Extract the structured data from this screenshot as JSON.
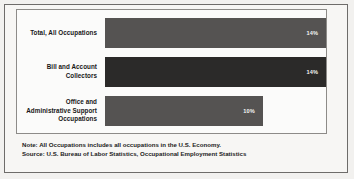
{
  "chart_data": {
    "type": "bar",
    "orientation": "horizontal",
    "title": "",
    "xlabel": "",
    "ylabel": "",
    "categories": [
      "Total, All Occupations",
      "Bill and Account Collectors",
      "Office and Administrative Support Occupations"
    ],
    "values": [
      14,
      14,
      10
    ],
    "value_labels": [
      "14%",
      "14%",
      "10%"
    ],
    "value_unit": "%",
    "xlim": [
      0,
      14
    ],
    "grid": false,
    "legend": false,
    "bar_colors": [
      "#555352",
      "#2b2a29",
      "#555352"
    ],
    "value_label_color": "#f3f3f3",
    "bars": [
      {
        "label_lines": [
          "Total, All Occupations"
        ],
        "value": 14,
        "value_label": "14%",
        "color": "#555352",
        "width_pct": 100
      },
      {
        "label_lines": [
          "Bill and Account",
          "Collectors"
        ],
        "value": 14,
        "value_label": "14%",
        "color": "#2b2a29",
        "width_pct": 100
      },
      {
        "label_lines": [
          "Office and",
          "Administrative Support",
          "Occupations"
        ],
        "value": 10,
        "value_label": "10%",
        "color": "#555352",
        "width_pct": 71.4
      }
    ]
  },
  "notes": {
    "note": "Note: All Occupations includes all occupations in the U.S. Economy.",
    "source": "Source: U.S. Bureau of Labor Statistics, Occupational Employment Statistics"
  }
}
